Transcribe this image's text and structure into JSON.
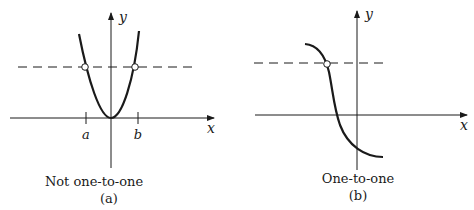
{
  "figure": {
    "panels": [
      {
        "id": "a",
        "caption": "Not one-to-one",
        "label": "(a)",
        "x_axis_label": "x",
        "y_axis_label": "y",
        "tick_labels": [
          "a",
          "b"
        ],
        "curve": "parabola",
        "horizontal_line": "dashed",
        "intersections": 2
      },
      {
        "id": "b",
        "caption": "One-to-one",
        "label": "(b)",
        "x_axis_label": "x",
        "y_axis_label": "y",
        "curve": "decreasing",
        "horizontal_line": "dashed",
        "intersections": 1
      }
    ],
    "colors": {
      "ink": "#1a1a1a",
      "background": "#ffffff"
    }
  }
}
